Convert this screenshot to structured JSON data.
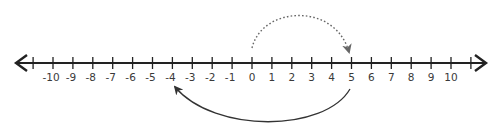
{
  "diagram": {
    "type": "number-line",
    "range": [
      -10,
      10
    ],
    "tick_labels": [
      "-10",
      "-9",
      "-8",
      "-7",
      "-6",
      "-5",
      "-4",
      "-3",
      "-2",
      "-1",
      "0",
      "1",
      "2",
      "3",
      "4",
      "5",
      "6",
      "7",
      "8",
      "9",
      "10"
    ],
    "unlabeled_end_ticks": [
      -11,
      11
    ],
    "arrows_both_ends": true,
    "jumps": [
      {
        "from": 0,
        "to": 5,
        "style": "dotted",
        "position": "above",
        "color": "#555555"
      },
      {
        "from": 5,
        "to": -4,
        "style": "solid",
        "position": "below",
        "color": "#333333"
      }
    ],
    "line_color": "#222222"
  }
}
